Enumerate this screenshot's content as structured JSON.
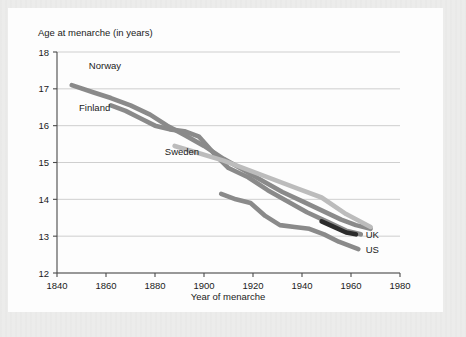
{
  "chart_data": {
    "type": "line",
    "title": "",
    "xlabel": "Year of menarche",
    "ylabel": "Age at menarche (in years)",
    "xlim": [
      1840,
      1980
    ],
    "ylim": [
      12,
      18
    ],
    "xticks": [
      1840,
      1860,
      1880,
      1900,
      1920,
      1940,
      1960,
      1980
    ],
    "yticks": [
      12,
      13,
      14,
      15,
      16,
      17,
      18
    ],
    "grid": "horizontal",
    "legend_position": "inline-labels",
    "series": [
      {
        "name": "Norway",
        "color": "#8a8a8a",
        "label_x": 1853,
        "label_y": 17.55,
        "x": [
          1846,
          1855,
          1862,
          1870,
          1878,
          1885,
          1892,
          1900,
          1908,
          1916,
          1924,
          1932,
          1940,
          1948,
          1956,
          1962,
          1968
        ],
        "values": [
          17.1,
          16.9,
          16.75,
          16.55,
          16.3,
          16.0,
          15.75,
          15.45,
          15.1,
          14.8,
          14.5,
          14.2,
          13.95,
          13.7,
          13.45,
          13.3,
          13.2
        ]
      },
      {
        "name": "Finland",
        "color": "#8a8a8a",
        "label_x": 1849,
        "label_y": 16.4,
        "x": [
          1862,
          1868,
          1874,
          1880,
          1886,
          1892,
          1898,
          1904,
          1910,
          1918,
          1926,
          1934,
          1942,
          1950,
          1958,
          1964
        ],
        "values": [
          16.55,
          16.4,
          16.2,
          16.0,
          15.9,
          15.85,
          15.7,
          15.25,
          14.85,
          14.6,
          14.25,
          13.95,
          13.65,
          13.4,
          13.15,
          13.05
        ]
      },
      {
        "name": "Sweden",
        "color": "#bcbcbc",
        "label_x": 1884,
        "label_y": 15.2,
        "x": [
          1888,
          1898,
          1908,
          1918,
          1928,
          1938,
          1948,
          1958,
          1968
        ],
        "values": [
          15.45,
          15.25,
          15.05,
          14.8,
          14.55,
          14.3,
          14.05,
          13.6,
          13.25
        ]
      },
      {
        "name": "UK",
        "color": "#2b2b2b",
        "label_x": 1966,
        "label_y": 12.95,
        "x": [
          1948,
          1953,
          1958,
          1962
        ],
        "values": [
          13.4,
          13.25,
          13.1,
          13.05
        ]
      },
      {
        "name": "US",
        "color": "#8a8a8a",
        "label_x": 1966,
        "label_y": 12.55,
        "x": [
          1907,
          1913,
          1919,
          1925,
          1931,
          1937,
          1943,
          1949,
          1955,
          1963
        ],
        "values": [
          14.15,
          14.0,
          13.9,
          13.55,
          13.3,
          13.25,
          13.2,
          13.05,
          12.85,
          12.65
        ]
      }
    ]
  },
  "axes": {
    "ylabel": "Age at menarche (in years)",
    "xlabel": "Year of menarche",
    "yticklabels": [
      "18",
      "17",
      "16",
      "15",
      "14",
      "13",
      "12"
    ],
    "xticklabels": [
      "1840",
      "1860",
      "1880",
      "1900",
      "1920",
      "1940",
      "1960",
      "1980"
    ]
  },
  "series_labels": {
    "norway": "Norway",
    "finland": "Finland",
    "sweden": "Sweden",
    "uk": "UK",
    "us": "US"
  },
  "colors": {
    "norway": "#8a8a8a",
    "finland": "#8a8a8a",
    "sweden": "#bcbcbc",
    "uk": "#2b2b2b",
    "us": "#8a8a8a",
    "grid": "#c9c9c9",
    "axis": "#4a4a4a",
    "panel": "#fdfdfd",
    "page": "#ececeb"
  }
}
